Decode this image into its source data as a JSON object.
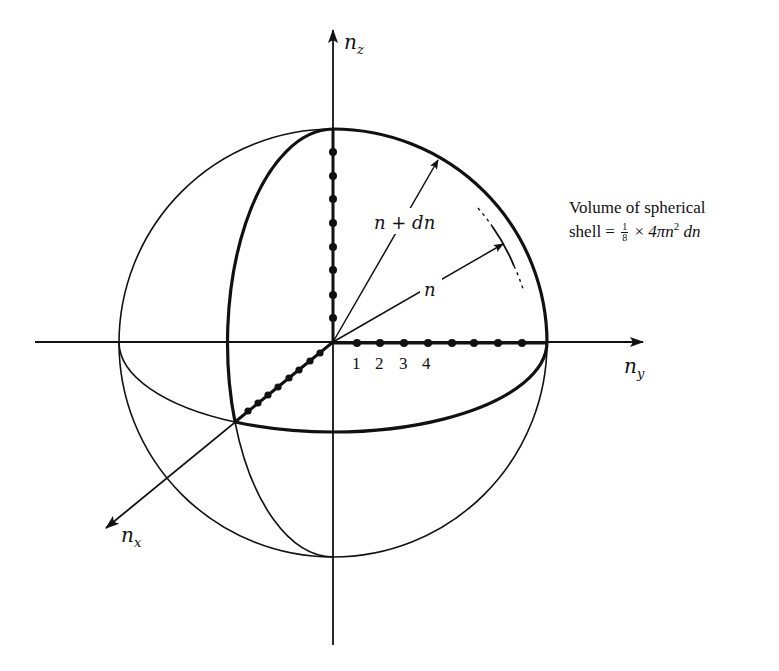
{
  "figure": {
    "axes": {
      "z": {
        "label_base": "n",
        "label_sub": "z"
      },
      "y": {
        "label_base": "n",
        "label_sub": "y"
      },
      "x": {
        "label_base": "n",
        "label_sub": "x"
      }
    },
    "y_axis_ticks": [
      "1",
      "2",
      "3",
      "4"
    ],
    "radius_labels": {
      "outer": "n + dn",
      "inner": "n"
    },
    "caption": {
      "line1": "Volume of spherical",
      "line2_prefix": "shell = ",
      "frac_num": "1",
      "frac_den": "8",
      "times": "×",
      "expr_a": "4πn",
      "expr_exp": "2",
      "expr_b": " dn"
    },
    "lattice_points": {
      "z_axis_count": 8,
      "y_axis_count": 8,
      "x_axis_count": 8
    },
    "colors": {
      "ink": "#111111",
      "background": "#ffffff"
    }
  }
}
